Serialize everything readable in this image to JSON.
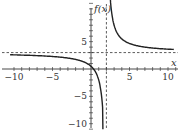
{
  "chart_data": {
    "type": "line",
    "title": "",
    "function": "f(x) = (3x - 1)/(x - 2)",
    "xlabel": "x",
    "ylabel": "f(x)",
    "xlim": [
      -10.5,
      10.8
    ],
    "ylim": [
      -11,
      12
    ],
    "x_ticks": [
      -10,
      -5,
      5,
      10
    ],
    "y_ticks": [
      5,
      -5,
      -10
    ],
    "x_tick_labels": [
      "−10",
      "−5",
      "5",
      "10"
    ],
    "y_tick_labels": [
      "5",
      "−5",
      "−10"
    ],
    "asymptotes": {
      "vertical": 2,
      "horizontal": 3
    },
    "grid": false,
    "series": [
      {
        "name": "f(x) left branch",
        "x": [
          -10.5,
          -8,
          -6,
          -4,
          -2,
          -1,
          0,
          0.5,
          1,
          1.3,
          1.5,
          1.55
        ],
        "y": [
          2.6,
          2.5,
          2.38,
          2.17,
          1.75,
          1.33,
          0.5,
          -0.33,
          -2,
          -4.14,
          -7,
          -8.1
        ]
      },
      {
        "name": "f(x) right branch",
        "x": [
          2.45,
          2.6,
          3,
          4,
          5,
          6,
          8,
          10.8
        ],
        "y": [
          14.1,
          11.33,
          8,
          5.5,
          4.67,
          4.25,
          3.83,
          3.57
        ]
      }
    ]
  }
}
